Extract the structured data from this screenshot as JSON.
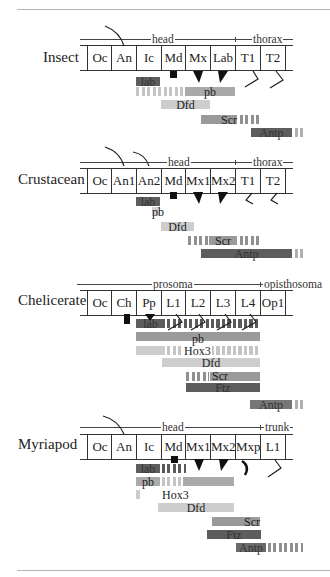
{
  "diagram": {
    "title_rules": {
      "top_y": 9,
      "bottom_y": 570
    },
    "panels": [
      {
        "species": "Insect",
        "regions": [
          {
            "label": "head"
          },
          {
            "label": "thorax"
          }
        ],
        "segments": [
          "Oc",
          "An",
          "Ic",
          "Md",
          "Mx",
          "Lab",
          "T1",
          "T2"
        ],
        "genes": [
          {
            "name": "lab",
            "shade": "dark"
          },
          {
            "name": "pb",
            "shade": "mid"
          },
          {
            "name": "Dfd",
            "shade": "light"
          },
          {
            "name": "Scr",
            "shade": "mid"
          },
          {
            "name": "Antp",
            "shade": "dark"
          }
        ]
      },
      {
        "species": "Crustacean",
        "regions": [
          {
            "label": "head"
          },
          {
            "label": "thorax"
          }
        ],
        "segments": [
          "Oc",
          "An1",
          "An2",
          "Md",
          "Mx1",
          "Mx2",
          "T1",
          "T2"
        ],
        "genes": [
          {
            "name": "lab",
            "shade": "dark"
          },
          {
            "name": "pb",
            "shade": "light"
          },
          {
            "name": "Dfd",
            "shade": "light"
          },
          {
            "name": "Scr",
            "shade": "mid"
          },
          {
            "name": "Antp",
            "shade": "dark"
          }
        ]
      },
      {
        "species": "Chelicerate",
        "regions": [
          {
            "label": "prosoma"
          },
          {
            "label": "opisthosoma"
          }
        ],
        "segments": [
          "Oc",
          "Ch",
          "Pp",
          "L1",
          "L2",
          "L3",
          "L4",
          "Op1"
        ],
        "genes": [
          {
            "name": "lab",
            "shade": "dark"
          },
          {
            "name": "pb",
            "shade": "mid"
          },
          {
            "name": "Hox3",
            "shade": "light"
          },
          {
            "name": "Dfd",
            "shade": "light"
          },
          {
            "name": "Scr",
            "shade": "mid"
          },
          {
            "name": "Ftz",
            "shade": "dark"
          },
          {
            "name": "Antp",
            "shade": "dark"
          }
        ]
      },
      {
        "species": "Myriapod",
        "regions": [
          {
            "label": "head"
          },
          {
            "label": "trunk"
          }
        ],
        "segments": [
          "Oc",
          "An",
          "Ic",
          "Md",
          "Mx1",
          "Mx2",
          "Mxp",
          "L1"
        ],
        "genes": [
          {
            "name": "lab",
            "shade": "dark"
          },
          {
            "name": "pb",
            "shade": "mid"
          },
          {
            "name": "Hox3",
            "shade": "light"
          },
          {
            "name": "Dfd",
            "shade": "light"
          },
          {
            "name": "Scr",
            "shade": "mid"
          },
          {
            "name": "Ftz",
            "shade": "dark"
          },
          {
            "name": "Antp",
            "shade": "dark"
          }
        ]
      }
    ]
  }
}
